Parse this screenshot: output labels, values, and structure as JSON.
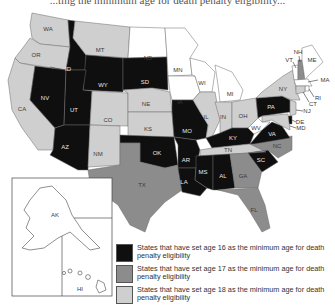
{
  "colors": {
    "age16": "#0f0f0f",
    "age17": "#8c8c8c",
    "age18": "#cfcfcf",
    "none": "#ffffff"
  },
  "legend": [
    {
      "category": "age16",
      "label": "States that have set age 16 as the minimum age for death penalty eligibility"
    },
    {
      "category": "age17",
      "label": "States that have set age 17 as the minimum age for death penalty eligibility"
    },
    {
      "category": "age18",
      "label": "States that have set age 18 as the minimum age for death penalty eligibility"
    }
  ],
  "states": {
    "WA": "age18",
    "OR": "age18",
    "CA": "age18",
    "ID": "age16",
    "NV": "age16",
    "MT": "age18",
    "WY": "age16",
    "UT": "age16",
    "AZ": "age16",
    "CO": "age18",
    "NM": "age18",
    "ND": "none",
    "SD": "age16",
    "NE": "age18",
    "KS": "age18",
    "OK": "age16",
    "TX": "age17",
    "MN": "none",
    "IA": "none",
    "MO": "age16",
    "AR": "age16",
    "LA": "age16",
    "WI": "none",
    "IL": "age18",
    "MI": "none",
    "IN": "age18",
    "OH": "age18",
    "KY": "age16",
    "TN": "age18",
    "MS": "age16",
    "AL": "age16",
    "GA": "age17",
    "FL": "age17",
    "SC": "age16",
    "NC": "age17",
    "VA": "age16",
    "WV": "none",
    "PA": "age16",
    "NY": "age18",
    "VT": "none",
    "NH": "age17",
    "ME": "none",
    "MA": "none",
    "RI": "none",
    "CT": "age18",
    "NJ": "age18",
    "DE": "age16",
    "MD": "age18",
    "AK": "none",
    "HI": "none"
  },
  "labels": {
    "WA": "WA",
    "OR": "OR",
    "CA": "CA",
    "ID": "ID",
    "NV": "NV",
    "MT": "MT",
    "WY": "WY",
    "UT": "UT",
    "AZ": "AZ",
    "CO": "CO",
    "NM": "NM",
    "ND": "ND",
    "SD": "SD",
    "NE": "NE",
    "KS": "KS",
    "OK": "OK",
    "TX": "TX",
    "MN": "MN",
    "IA": "IA",
    "MO": "MO",
    "AR": "AR",
    "LA": "LA",
    "WI": "WI",
    "IL": "IL",
    "MI": "MI",
    "IN": "IN",
    "OH": "OH",
    "KY": "KY",
    "TN": "TN",
    "MS": "MS",
    "AL": "AL",
    "GA": "GA",
    "FL": "FL",
    "SC": "SC",
    "NC": "NC",
    "VA": "VA",
    "WV": "WV",
    "PA": "PA",
    "NY": "NY",
    "VT": "VT",
    "NH": "NH",
    "ME": "ME",
    "MA": "MA",
    "RI": "RI",
    "CT": "CT",
    "NJ": "NJ",
    "DE": "DE",
    "MD": "MD",
    "AK": "AK",
    "HI": "HI"
  },
  "title_fragment": "...ting the minimum age for death penalty eligibility..."
}
